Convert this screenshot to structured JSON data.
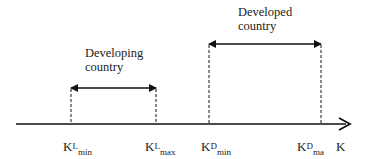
{
  "diagram": {
    "axis_label": "K",
    "ranges": [
      {
        "name": "developing",
        "label_line1": "Developing",
        "label_line2": "country",
        "min_label": {
          "base": "K",
          "sup": "L",
          "sub": "min"
        },
        "max_label": {
          "base": "K",
          "sup": "L",
          "sub": "max"
        }
      },
      {
        "name": "developed",
        "label_line1": "Developed",
        "label_line2": "country",
        "min_label": {
          "base": "K",
          "sup": "D",
          "sub": "min"
        },
        "max_label": {
          "base": "K",
          "sup": "D",
          "sub": "ma"
        }
      }
    ],
    "colors": {
      "line": "#111111",
      "text": "#222222"
    }
  }
}
